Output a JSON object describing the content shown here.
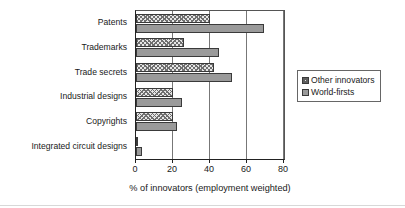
{
  "chart_data": {
    "type": "bar",
    "orientation": "horizontal",
    "title": "",
    "xlabel": "% of innovators (employment weighted)",
    "ylabel": "",
    "xlim": [
      0,
      80
    ],
    "xticks": [
      0,
      20,
      40,
      60,
      80
    ],
    "grid": true,
    "legend_position": "right",
    "categories": [
      "Integrated circuit designs",
      "Copyrights",
      "Industrial designs",
      "Trade secrets",
      "Trademarks",
      "Patents"
    ],
    "series": [
      {
        "name": "Other innovators",
        "pattern": "cross-hatch",
        "color": "#e6e6e6",
        "values": [
          1,
          20,
          20,
          42,
          26,
          40
        ]
      },
      {
        "name": "World-firsts",
        "pattern": "solid",
        "color": "#9a9a9a",
        "values": [
          3,
          22,
          25,
          52,
          45,
          69
        ]
      }
    ]
  },
  "legend": {
    "items": [
      {
        "label": "Other innovators"
      },
      {
        "label": "World-firsts"
      }
    ]
  },
  "axis": {
    "x_title": "% of innovators (employment weighted)",
    "tick_labels": [
      "0",
      "20",
      "40",
      "60",
      "80"
    ]
  }
}
